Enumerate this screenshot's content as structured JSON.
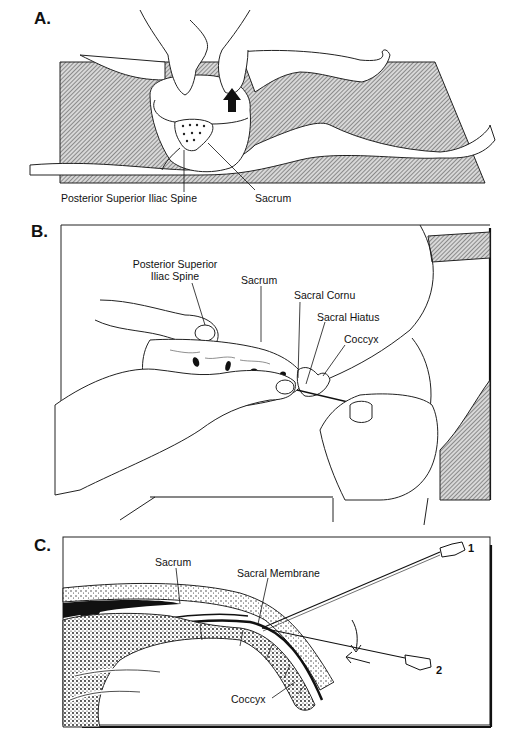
{
  "figure": {
    "panels": [
      {
        "letter": "A.",
        "labels": {
          "psis": "Posterior Superior Iliac Spine",
          "sacrum": "Sacrum"
        }
      },
      {
        "letter": "B.",
        "labels": {
          "psis_line1": "Posterior Superior",
          "psis_line2": "Iliac Spine",
          "sacrum": "Sacrum",
          "sacral_cornu": "Sacral Cornu",
          "sacral_hiatus": "Sacral Hiatus",
          "coccyx": "Coccyx"
        }
      },
      {
        "letter": "C.",
        "labels": {
          "sacrum": "Sacrum",
          "sacral_membrane": "Sacral Membrane",
          "coccyx": "Coccyx",
          "needle_1": "1",
          "needle_2": "2"
        }
      }
    ],
    "colors": {
      "ink": "#111111",
      "hatch": "#7a7a7a",
      "paper": "#ffffff"
    }
  }
}
